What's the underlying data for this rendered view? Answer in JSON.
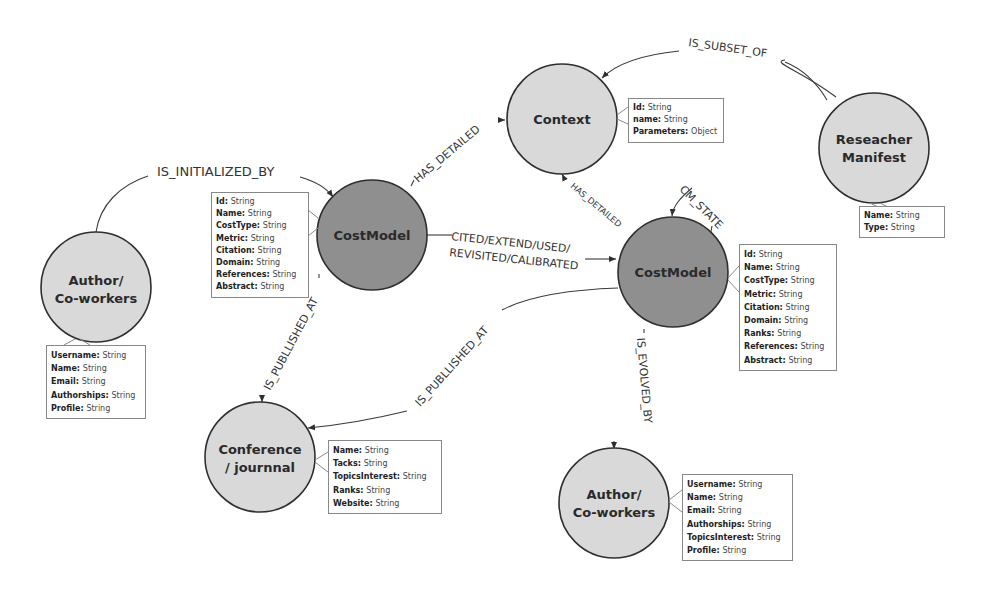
{
  "colors": {
    "costmodel_fill": "#8f8f8f",
    "entity_fill": "#d9d9d9",
    "stroke": "#2f2f2f"
  },
  "nodes": {
    "context": {
      "label": "Context",
      "props": [
        {
          "key": "Id",
          "type": "String"
        },
        {
          "key": "name",
          "type": "String"
        },
        {
          "key": "Parameters",
          "type": "Object"
        }
      ]
    },
    "researcher_manifest": {
      "label_line1": "Reseacher",
      "label_line2": "Manifest",
      "props": [
        {
          "key": "Name",
          "type": "String"
        },
        {
          "key": "Type",
          "type": "String"
        }
      ]
    },
    "costmodel_1": {
      "label": "CostModel",
      "props": [
        {
          "key": "Id",
          "type": "String"
        },
        {
          "key": "Name",
          "type": "String"
        },
        {
          "key": "CostType",
          "type": "String"
        },
        {
          "key": "Metric",
          "type": "String"
        },
        {
          "key": "Citation",
          "type": "String"
        },
        {
          "key": "Domain",
          "type": "String"
        },
        {
          "key": "References",
          "type": "String"
        },
        {
          "key": "Abstract",
          "type": "String"
        }
      ]
    },
    "costmodel_2": {
      "label": "CostModel",
      "props": [
        {
          "key": "Id",
          "type": "String"
        },
        {
          "key": "Name",
          "type": "String"
        },
        {
          "key": "CostType",
          "type": "String"
        },
        {
          "key": "Metric",
          "type": "String"
        },
        {
          "key": "Citation",
          "type": "String"
        },
        {
          "key": "Domain",
          "type": "String"
        },
        {
          "key": "Ranks",
          "type": "String"
        },
        {
          "key": "References",
          "type": "String"
        },
        {
          "key": "Abstract",
          "type": "String"
        }
      ]
    },
    "author_1": {
      "label_line1": "Author/",
      "label_line2": "Co-workers",
      "props": [
        {
          "key": "Username",
          "type": "String"
        },
        {
          "key": "Name",
          "type": "String"
        },
        {
          "key": "Email",
          "type": "String"
        },
        {
          "key": "Authorships",
          "type": "String"
        },
        {
          "key": "Profile",
          "type": "String"
        }
      ]
    },
    "conference": {
      "label_line1": "Conference",
      "label_line2": "/ journnal",
      "props": [
        {
          "key": "Name",
          "type": "String"
        },
        {
          "key": "Tacks",
          "type": "String"
        },
        {
          "key": "TopicsInterest",
          "type": "String"
        },
        {
          "key": "Ranks",
          "type": "String"
        },
        {
          "key": "Website",
          "type": "String"
        }
      ]
    },
    "author_2": {
      "label_line1": "Author/",
      "label_line2": "Co-workers",
      "props": [
        {
          "key": "Username",
          "type": "String"
        },
        {
          "key": "Name",
          "type": "String"
        },
        {
          "key": "Email",
          "type": "String"
        },
        {
          "key": "Authorships",
          "type": "String"
        },
        {
          "key": "TopicsInterest",
          "type": "String"
        },
        {
          "key": "Profile",
          "type": "String"
        }
      ]
    }
  },
  "edges": {
    "is_subset_of": "IS_SUBSET_OF",
    "is_initialized_by": "IS_INITIALIZED_BY",
    "has_detailed_1": "HAS_DETAILED",
    "has_detailed_2": "HAS_DETAILED",
    "cm_state": "CM_STATE",
    "cited_line1": "CITED/EXTEND/USED/",
    "cited_line2": "REVISITED/CALIBRATED",
    "is_published_at_1": "IS_PUBLLISHED_AT",
    "is_published_at_2": "IS_PUBLLISHED_AT",
    "is_evolved_by": "IS_EVOLVED_BY"
  }
}
